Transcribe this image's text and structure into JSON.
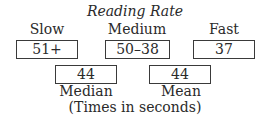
{
  "diagram": {
    "title": "Reading Rate",
    "categories": [
      {
        "label": "Slow",
        "value": "51+"
      },
      {
        "label": "Medium",
        "value": "50–38"
      },
      {
        "label": "Fast",
        "value": "37"
      }
    ],
    "stats": [
      {
        "label": "Median",
        "value": "44"
      },
      {
        "label": "Mean",
        "value": "44"
      }
    ],
    "note": "(Times in seconds)"
  }
}
